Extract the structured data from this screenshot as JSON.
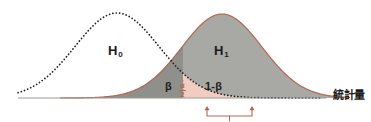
{
  "figure": {
    "axis_label": "統計量",
    "labels": {
      "null_hypothesis": "H",
      "null_hypothesis_sub": "0",
      "alt_hypothesis": "H",
      "alt_hypothesis_sub": "1",
      "beta": "β",
      "power": "1-β",
      "alpha_numerator": "α",
      "alpha_denominator": "2"
    },
    "colors": {
      "h1_curve": "#b5674f",
      "h1_fill": "#a8a8a5",
      "overlap_fill": "#8f8f8c",
      "alpha_fill": "#f0cdc0",
      "h0_curve": "#1c1c1c",
      "bracket": "#b5674f",
      "baseline": "#9a9a98",
      "background": "#ffffff"
    }
  },
  "chart_data": {
    "type": "line",
    "xlabel": "統計量",
    "ylabel": "",
    "grid": false,
    "legend": "none",
    "xlim": [
      0,
      371
    ],
    "ylim": [
      0,
      98
    ],
    "baseline_y": 98,
    "annotations": [
      {
        "text": "H0",
        "x": 117,
        "y": 50,
        "role": "null-distribution-label"
      },
      {
        "text": "H1",
        "x": 222,
        "y": 50,
        "role": "alternative-distribution-label"
      },
      {
        "text": "β",
        "x": 168,
        "y": 86,
        "role": "type-ii-error-region"
      },
      {
        "text": "1-β",
        "x": 215,
        "y": 86,
        "role": "power-region"
      },
      {
        "text": "α/2",
        "x": 183,
        "y": 88,
        "role": "significance-level-region"
      },
      {
        "text": "統計量",
        "x": 335,
        "y": 96,
        "role": "axis-label"
      }
    ],
    "series": [
      {
        "name": "H0",
        "style": "dotted",
        "color": "#1c1c1c",
        "filled": false,
        "peak_x": 117,
        "peak_y": 13,
        "mean": 117,
        "sigma": 42,
        "x_start": 18,
        "x_end": 320
      },
      {
        "name": "H1",
        "style": "solid",
        "color": "#b5674f",
        "filled": true,
        "fill": "#a8a8a5",
        "peak_x": 222,
        "peak_y": 14,
        "mean": 222,
        "sigma": 40,
        "x_start": 60,
        "x_end": 350
      }
    ],
    "critical_value_x": 183,
    "bracket": {
      "x_start": 207,
      "x_end": 252,
      "y": 105,
      "color": "#b5674f",
      "arrows": "both-up",
      "center_tick": true
    }
  }
}
